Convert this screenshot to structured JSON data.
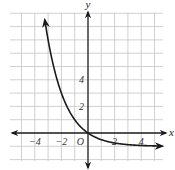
{
  "chart_data": {
    "type": "line",
    "title": "",
    "function": "y = 2^(-x) - 1",
    "xlabel": "x",
    "ylabel": "y",
    "origin_label": "O",
    "x_ticks": [
      -4,
      -2,
      2,
      4
    ],
    "x_tick_labels": [
      "−4",
      "−2",
      "2",
      "4"
    ],
    "y_ticks": [
      2,
      4
    ],
    "y_tick_labels": [
      "2",
      "4"
    ],
    "xlim": [
      -6,
      5.5
    ],
    "ylim": [
      -2,
      9.5
    ],
    "grid": true,
    "grid_step": 1,
    "asymptote": -1,
    "series": [
      {
        "name": "curve",
        "x": [
          -3.2,
          -3,
          -2.5,
          -2,
          -1.5,
          -1,
          -0.5,
          0,
          0.5,
          1,
          2,
          3,
          4,
          5
        ],
        "values": [
          8.19,
          7,
          4.66,
          3,
          1.83,
          1,
          0.41,
          0,
          -0.29,
          -0.5,
          -0.75,
          -0.88,
          -0.94,
          -0.97
        ]
      }
    ]
  },
  "colors": {
    "grid": "#bdbdbd",
    "axis": "#1a1a1a",
    "curve": "#1a1a1a"
  }
}
